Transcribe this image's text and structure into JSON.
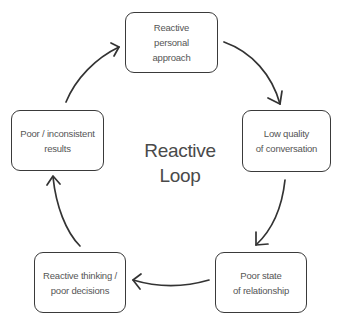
{
  "diagram": {
    "title": "Reactive\nLoop",
    "type": "cycle",
    "colors": {
      "stroke": "#3a3a3a",
      "text": "#555555",
      "background": "#ffffff"
    },
    "nodes": [
      {
        "id": "n1",
        "label": "Reactive\npersonal\napproach"
      },
      {
        "id": "n2",
        "label": "Low quality\nof conversation"
      },
      {
        "id": "n3",
        "label": "Poor state\nof relationship"
      },
      {
        "id": "n4",
        "label": "Reactive thinking /\npoor decisions"
      },
      {
        "id": "n5",
        "label": "Poor / inconsistent\nresults"
      }
    ],
    "edges": [
      {
        "from": "n1",
        "to": "n2",
        "direction": "clockwise"
      },
      {
        "from": "n2",
        "to": "n3",
        "direction": "clockwise"
      },
      {
        "from": "n3",
        "to": "n4",
        "direction": "clockwise"
      },
      {
        "from": "n4",
        "to": "n5",
        "direction": "clockwise"
      },
      {
        "from": "n5",
        "to": "n1",
        "direction": "clockwise"
      }
    ]
  }
}
